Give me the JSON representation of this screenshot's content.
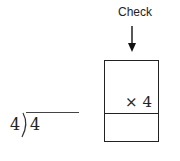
{
  "check": {
    "label": "Check"
  },
  "box": {
    "multiplier": "× 4",
    "bottom_value": ""
  },
  "division": {
    "divisor": "4",
    "dividend": "4",
    "quotient": ""
  }
}
